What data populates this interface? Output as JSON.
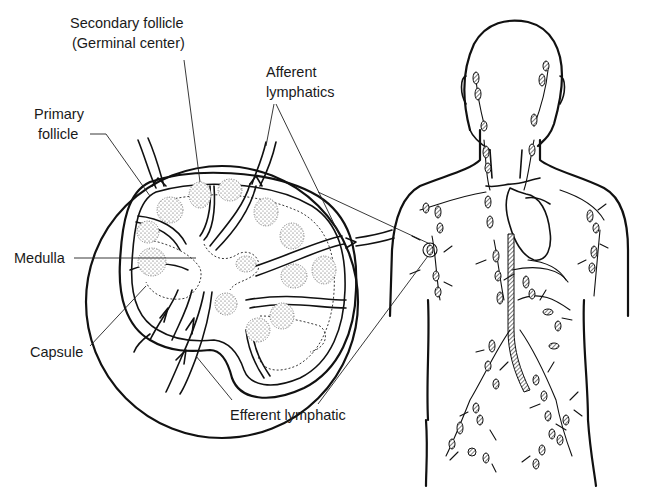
{
  "figure": {
    "background": "#ffffff",
    "ink_color": "#111111"
  },
  "labels": {
    "secondary_follicle": {
      "line1": "Secondary follicle",
      "line2": "(Germinal center)"
    },
    "afferent_lymphatics": {
      "line1": "Afferent",
      "line2": "lymphatics"
    },
    "primary_follicle": {
      "line1": "Primary",
      "line2": "follicle"
    },
    "medulla": {
      "text": "Medulla"
    },
    "capsule": {
      "text": "Capsule"
    },
    "efferent_lymphatic": {
      "text": "Efferent lymphatic"
    }
  },
  "panels": [
    {
      "name": "lymph-node-cross-section",
      "description": "Enlarged cross-section of a lymph node inside a circular magnification inset"
    },
    {
      "name": "human-lymphatic-system",
      "description": "Outline of human head and torso showing lymph vessels and nodes"
    }
  ],
  "callout": {
    "from": "magnified-inset-circle",
    "to": "axillary-lymph-node"
  }
}
